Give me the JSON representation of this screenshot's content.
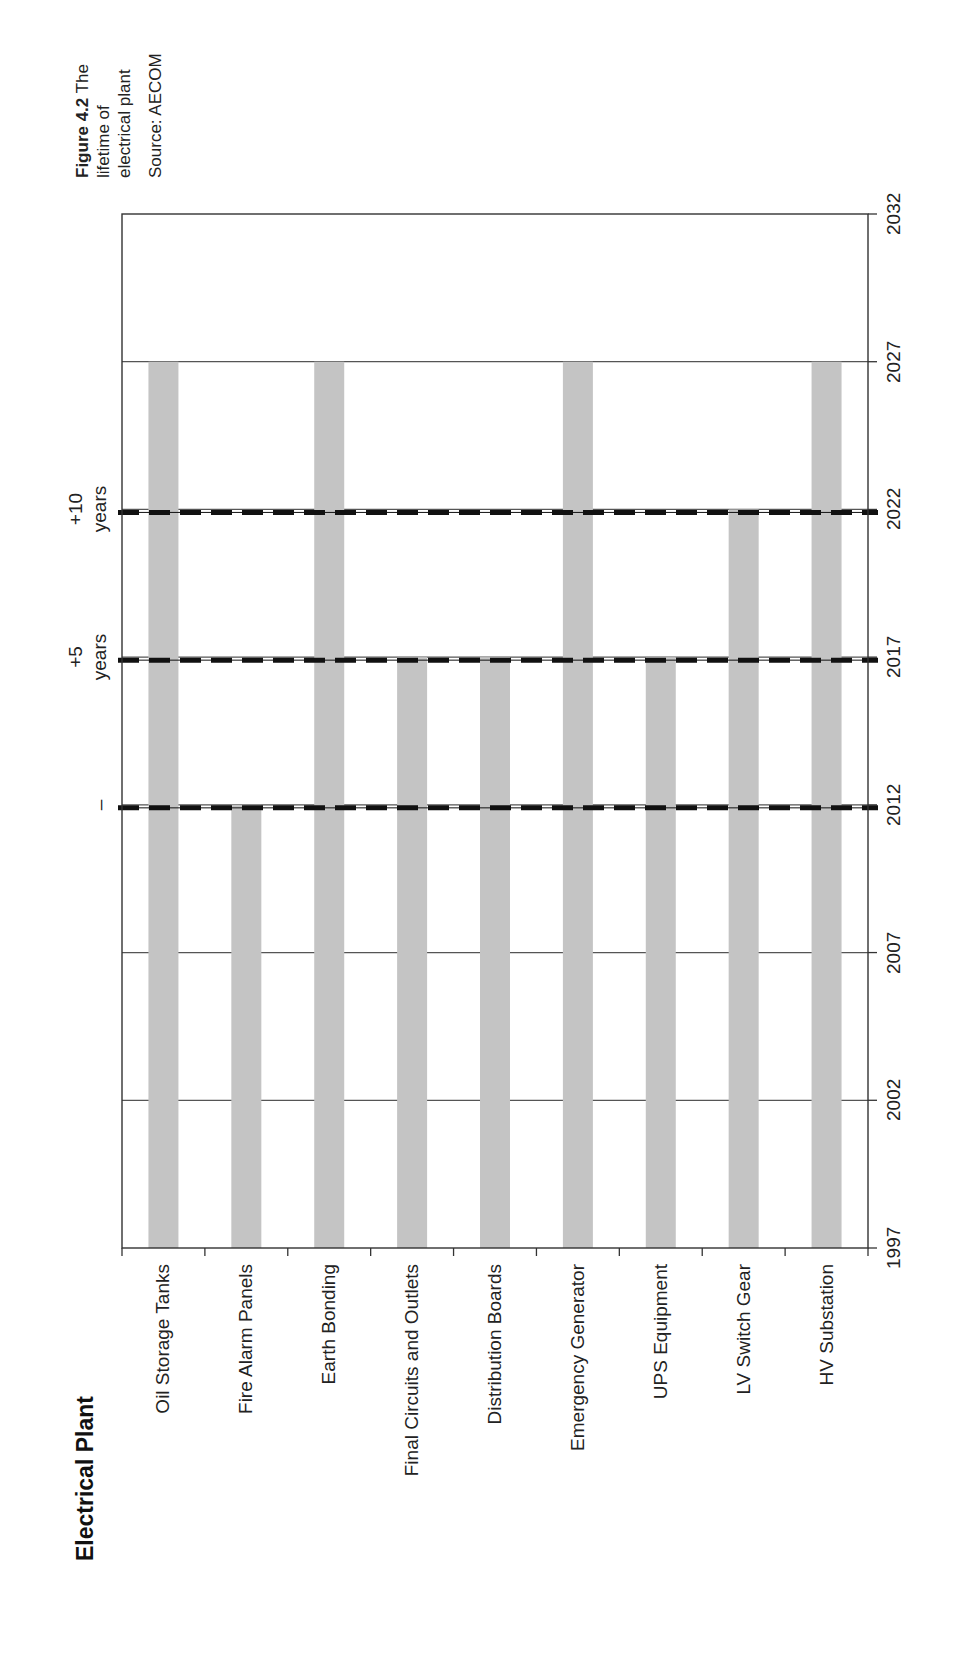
{
  "caption": {
    "figure_label": "Figure 4.2",
    "text_line1": " The",
    "text_line2": "lifetime of",
    "text_line3": "electrical plant",
    "source": "Source: AECOM"
  },
  "title": "Electrical Plant",
  "annotations": [
    {
      "label_line1": "–",
      "label_line2": "",
      "year": 2012
    },
    {
      "label_line1": "+5",
      "label_line2": "years",
      "year": 2017
    },
    {
      "label_line1": "+10",
      "label_line2": "years",
      "year": 2022
    }
  ],
  "colors": {
    "bar": "#c4c4c4",
    "gridline": "#555555",
    "frame": "#333333",
    "dash": "#111111"
  },
  "chart_data": {
    "type": "bar",
    "orientation": "vertical-floating (rotated page, lifetimes from 1997)",
    "title": "Electrical Plant",
    "caption": "Figure 4.2 The lifetime of electrical plant. Source: AECOM",
    "categories": [
      "Oil Storage Tanks",
      "Fire Alarm Panels",
      "Earth Bonding",
      "Final Circuits and Outlets",
      "Distribution Boards",
      "Emergency Generator",
      "UPS Equipment",
      "LV Switch Gear",
      "HV Substation"
    ],
    "start_year": 1997,
    "values": [
      2027,
      2012,
      2027,
      2017,
      2017,
      2027,
      2017,
      2022,
      2027
    ],
    "lifetimes_years": [
      30,
      15,
      30,
      20,
      20,
      30,
      20,
      25,
      30
    ],
    "year_ticks": [
      1997,
      2002,
      2007,
      2012,
      2017,
      2022,
      2027,
      2032
    ],
    "ylim": [
      1997,
      2032
    ],
    "reference_lines": [
      {
        "year": 2012,
        "label": "–"
      },
      {
        "year": 2017,
        "label": "+5 years"
      },
      {
        "year": 2022,
        "label": "+10 years"
      }
    ],
    "grid": true,
    "legend": null,
    "xlabel": "",
    "ylabel": ""
  }
}
